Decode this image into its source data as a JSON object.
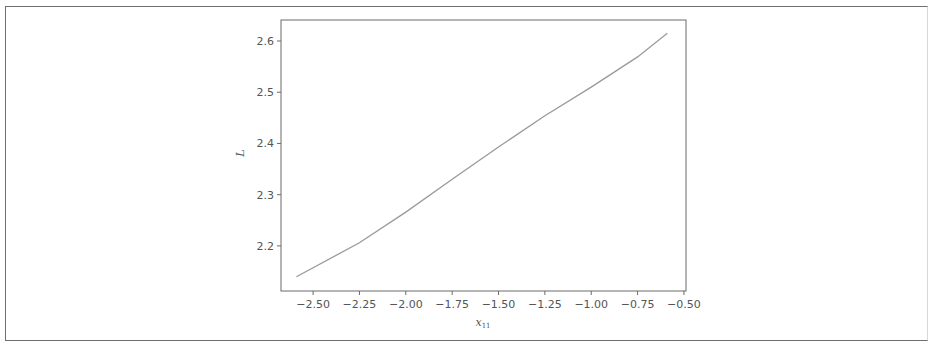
{
  "chart_data": {
    "type": "line",
    "title": "",
    "xlabel": "x",
    "xlabel_subscript": "11",
    "ylabel": "L",
    "xlim": [
      -2.673,
      -0.489
    ],
    "ylim": [
      2.112,
      2.641
    ],
    "grid": false,
    "legend": null,
    "x_ticks": [
      -2.5,
      -2.25,
      -2.0,
      -1.75,
      -1.5,
      -1.25,
      -1.0,
      -0.75,
      -0.5
    ],
    "x_tick_labels": [
      "−2.50",
      "−2.25",
      "−2.00",
      "−1.75",
      "−1.50",
      "−1.25",
      "−1.00",
      "−0.75",
      "−0.50"
    ],
    "y_ticks": [
      2.2,
      2.3,
      2.4,
      2.5,
      2.6
    ],
    "y_tick_labels": [
      "2.2",
      "2.3",
      "2.4",
      "2.5",
      "2.6"
    ],
    "series": [
      {
        "name": "L",
        "color": "#9a9a9a",
        "x": [
          -2.59,
          -2.25,
          -2.0,
          -1.75,
          -1.5,
          -1.25,
          -1.0,
          -0.75,
          -0.59
        ],
        "y": [
          2.14,
          2.206,
          2.266,
          2.33,
          2.393,
          2.454,
          2.51,
          2.569,
          2.615
        ]
      }
    ]
  },
  "colors": {
    "axes": "#6a6a6a",
    "line": "#9a9a9a",
    "text": "#555555",
    "frame": "#6f6f6f"
  }
}
